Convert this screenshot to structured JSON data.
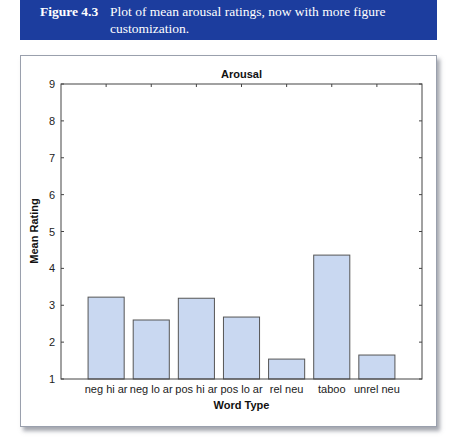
{
  "caption": {
    "figure_label": "Figure 4.3",
    "text": "Plot of mean arousal ratings, now with more figure customization.",
    "background": "#1c3d9e"
  },
  "chart_data": {
    "type": "bar",
    "title": "Arousal",
    "xlabel": "Word Type",
    "ylabel": "Mean Rating",
    "categories": [
      "neg hi ar",
      "neg lo ar",
      "pos hi ar",
      "pos lo ar",
      "rel neu",
      "taboo",
      "unrel neu"
    ],
    "values": [
      3.22,
      2.6,
      3.19,
      2.68,
      1.54,
      4.36,
      1.65
    ],
    "ylim": [
      1,
      9
    ],
    "yticks": [
      1,
      2,
      3,
      4,
      5,
      6,
      7,
      8,
      9
    ],
    "grid": false,
    "legend": null,
    "bar_color": "#c9d8f1",
    "bar_edge_color": "#555555"
  }
}
